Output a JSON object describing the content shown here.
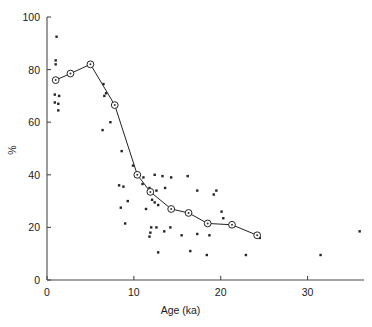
{
  "chart_data": {
    "type": "scatter",
    "title": "",
    "subtitle": "",
    "xlabel": "Age (ka)",
    "ylabel": "%",
    "xlim": [
      0,
      36.5
    ],
    "ylim": [
      0,
      100
    ],
    "xticks": [
      0,
      10,
      20,
      30
    ],
    "xtick_labels": [
      "0",
      "10",
      "20",
      "30"
    ],
    "yticks": [
      0,
      20,
      40,
      60,
      80,
      100
    ],
    "ytick_labels": [
      "0",
      "20",
      "40",
      "60",
      "80",
      "100"
    ],
    "grid": false,
    "legend": null,
    "legend_position": "none",
    "annotations": [],
    "series": [
      {
        "name": "mean-trend",
        "type": "line",
        "marker": "open-circle",
        "color": "#222222",
        "points": [
          {
            "x": 1.0,
            "y": 76.0
          },
          {
            "x": 2.7,
            "y": 78.5
          },
          {
            "x": 5.0,
            "y": 82.0
          },
          {
            "x": 7.8,
            "y": 66.5
          },
          {
            "x": 10.4,
            "y": 40.0
          },
          {
            "x": 11.9,
            "y": 33.5
          },
          {
            "x": 14.3,
            "y": 27.0
          },
          {
            "x": 16.3,
            "y": 25.5
          },
          {
            "x": 18.5,
            "y": 21.5
          },
          {
            "x": 21.3,
            "y": 21.0
          },
          {
            "x": 24.2,
            "y": 17.0
          }
        ]
      },
      {
        "name": "individual-samples",
        "type": "scatter",
        "marker": "small-dot",
        "color": "#242424",
        "points": [
          {
            "x": 1.1,
            "y": 92.5
          },
          {
            "x": 1.0,
            "y": 83.5
          },
          {
            "x": 1.0,
            "y": 82.0
          },
          {
            "x": 0.9,
            "y": 70.5
          },
          {
            "x": 1.4,
            "y": 70.0
          },
          {
            "x": 0.9,
            "y": 67.5
          },
          {
            "x": 1.3,
            "y": 67.0
          },
          {
            "x": 1.3,
            "y": 64.5
          },
          {
            "x": 6.5,
            "y": 74.5
          },
          {
            "x": 6.8,
            "y": 71.0
          },
          {
            "x": 6.6,
            "y": 70.0
          },
          {
            "x": 7.3,
            "y": 60.0
          },
          {
            "x": 6.4,
            "y": 57.0
          },
          {
            "x": 8.6,
            "y": 49.0
          },
          {
            "x": 9.9,
            "y": 43.5
          },
          {
            "x": 11.1,
            "y": 39.0
          },
          {
            "x": 12.4,
            "y": 40.0
          },
          {
            "x": 13.3,
            "y": 39.5
          },
          {
            "x": 14.3,
            "y": 39.0
          },
          {
            "x": 16.2,
            "y": 39.5
          },
          {
            "x": 8.3,
            "y": 36.0
          },
          {
            "x": 8.8,
            "y": 35.5
          },
          {
            "x": 11.0,
            "y": 36.5
          },
          {
            "x": 11.8,
            "y": 35.0
          },
          {
            "x": 12.6,
            "y": 34.0
          },
          {
            "x": 13.6,
            "y": 35.0
          },
          {
            "x": 17.3,
            "y": 34.0
          },
          {
            "x": 19.5,
            "y": 34.0
          },
          {
            "x": 19.2,
            "y": 32.5
          },
          {
            "x": 9.3,
            "y": 30.0
          },
          {
            "x": 12.1,
            "y": 30.5
          },
          {
            "x": 12.4,
            "y": 29.5
          },
          {
            "x": 12.8,
            "y": 28.5
          },
          {
            "x": 8.5,
            "y": 27.5
          },
          {
            "x": 11.4,
            "y": 27.0
          },
          {
            "x": 20.1,
            "y": 26.0
          },
          {
            "x": 20.3,
            "y": 23.5
          },
          {
            "x": 9.0,
            "y": 21.5
          },
          {
            "x": 12.0,
            "y": 20.0
          },
          {
            "x": 12.6,
            "y": 20.0
          },
          {
            "x": 14.2,
            "y": 20.0
          },
          {
            "x": 13.5,
            "y": 18.5
          },
          {
            "x": 11.9,
            "y": 18.0
          },
          {
            "x": 15.5,
            "y": 17.0
          },
          {
            "x": 17.3,
            "y": 17.5
          },
          {
            "x": 18.7,
            "y": 17.0
          },
          {
            "x": 11.8,
            "y": 16.5
          },
          {
            "x": 24.5,
            "y": 16.0
          },
          {
            "x": 12.8,
            "y": 10.5
          },
          {
            "x": 16.5,
            "y": 11.0
          },
          {
            "x": 18.4,
            "y": 9.5
          },
          {
            "x": 22.9,
            "y": 9.5
          },
          {
            "x": 31.5,
            "y": 9.5
          },
          {
            "x": 36.0,
            "y": 18.5
          }
        ]
      }
    ]
  },
  "figure": {
    "background_color": "#ffffff",
    "axis_color": "#4a4a4a",
    "marker_color": "#222222"
  }
}
